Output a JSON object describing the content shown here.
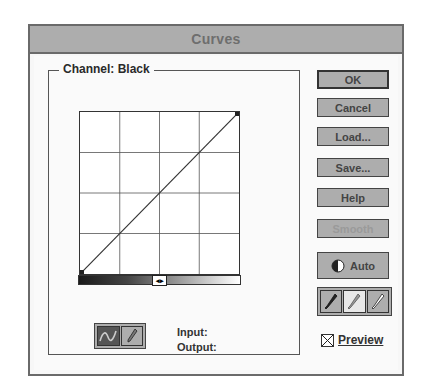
{
  "window": {
    "title": "Curves"
  },
  "channel": {
    "label": "Channel: Black"
  },
  "graph": {
    "grid_divisions": 4,
    "curve_points": [
      [
        0,
        0
      ],
      [
        255,
        255
      ]
    ]
  },
  "tools": [
    {
      "name": "curve-tool",
      "icon": "curve-icon",
      "active": true
    },
    {
      "name": "pencil-tool",
      "icon": "pencil-icon",
      "active": false
    }
  ],
  "readout": {
    "input_label": "Input:",
    "output_label": "Output:"
  },
  "buttons": {
    "ok": "OK",
    "cancel": "Cancel",
    "load": "Load...",
    "save": "Save...",
    "help": "Help",
    "smooth": "Smooth",
    "auto": "Auto"
  },
  "eyedroppers": [
    "black-eyedropper-icon",
    "gray-eyedropper-icon",
    "white-eyedropper-icon"
  ],
  "preview": {
    "label": "Preview",
    "checked": true
  }
}
